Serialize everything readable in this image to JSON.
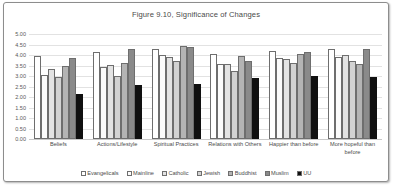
{
  "chart_data": {
    "type": "bar",
    "title": "Figure 9.10, Significance of Changes",
    "xlabel": "",
    "ylabel": "",
    "ylim": [
      0,
      5
    ],
    "ytick_step": 0.5,
    "grid": true,
    "legend_position": "bottom",
    "ytick_labels": [
      "5.00",
      "4.50",
      "4.00",
      "3.50",
      "3.00",
      "2.50",
      "2.00",
      "1.50",
      "1.00",
      "0.50",
      "0.00"
    ],
    "categories": [
      "Beliefs",
      "Actions/Lifestyle",
      "Spiritual Practices",
      "Relations with Others",
      "Happier than before",
      "More hopeful than before"
    ],
    "series": [
      {
        "name": "Evangelicals",
        "color": "#ffffff",
        "values": [
          3.95,
          4.12,
          4.3,
          4.04,
          4.18,
          4.31
        ]
      },
      {
        "name": "Mainline",
        "color": "#fbfbfb",
        "values": [
          3.07,
          3.43,
          3.99,
          3.57,
          3.87,
          3.9
        ]
      },
      {
        "name": "Catholic",
        "color": "#e3e3e3",
        "values": [
          3.35,
          3.53,
          3.92,
          3.57,
          3.8,
          3.99
        ]
      },
      {
        "name": "Jewish",
        "color": "#d2d2d2",
        "values": [
          2.95,
          3.0,
          3.73,
          3.23,
          3.62,
          3.72
        ]
      },
      {
        "name": "Buddhist",
        "color": "#b4b4b4",
        "values": [
          3.48,
          3.62,
          4.42,
          3.93,
          4.07,
          3.55
        ]
      },
      {
        "name": "Muslim",
        "color": "#8a8a8a",
        "values": [
          3.87,
          4.27,
          4.36,
          3.72,
          4.12,
          4.27
        ]
      },
      {
        "name": "UU",
        "color": "#101010",
        "values": [
          2.13,
          2.58,
          2.6,
          2.89,
          3.01,
          2.95
        ]
      }
    ]
  }
}
